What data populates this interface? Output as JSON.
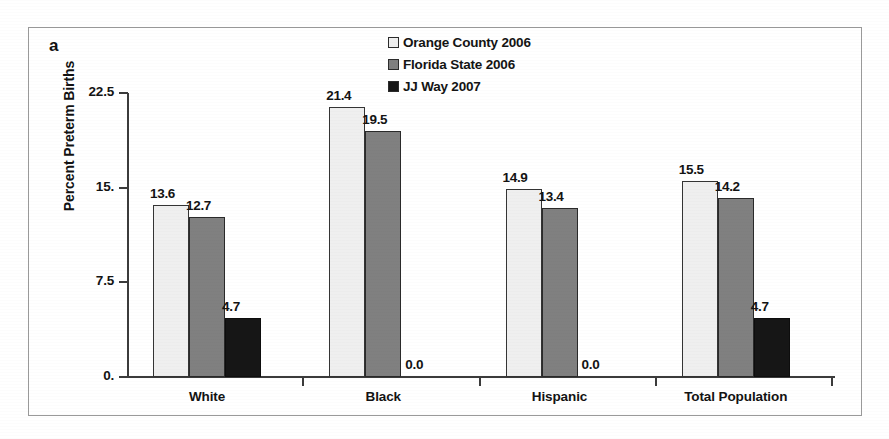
{
  "figure": {
    "panel_label": "a"
  },
  "chart_data": {
    "type": "bar",
    "title": "",
    "xlabel": "",
    "ylabel": "Percent Preterm Births",
    "ylim": [
      0,
      22.5
    ],
    "ytick_labels": [
      "22.5",
      "15.",
      "7.5",
      "0."
    ],
    "ytick_values": [
      22.5,
      15.0,
      7.5,
      0.0
    ],
    "grid": false,
    "legend_position": "top-center",
    "categories": [
      "White",
      "Black",
      "Hispanic",
      "Total Population"
    ],
    "series": [
      {
        "name": "Orange County 2006",
        "color": "#efefef",
        "values": [
          13.6,
          21.4,
          14.9,
          15.5
        ],
        "labels": [
          "13.6",
          "21.4",
          "14.9",
          "15.5"
        ]
      },
      {
        "name": "Florida State 2006",
        "color": "#808080",
        "values": [
          12.7,
          19.5,
          13.4,
          14.2
        ],
        "labels": [
          "12.7",
          "19.5",
          "13.4",
          "14.2"
        ]
      },
      {
        "name": "JJ Way 2007",
        "color": "#161616",
        "values": [
          4.7,
          0.0,
          0.0,
          4.7
        ],
        "labels": [
          "4.7",
          "0.0",
          "0.0",
          "4.7"
        ]
      }
    ]
  }
}
